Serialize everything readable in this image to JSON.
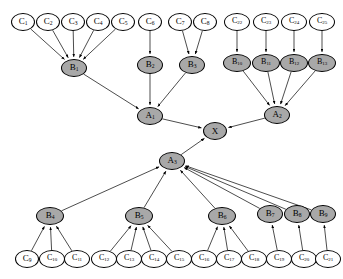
{
  "diagram": {
    "type": "dag",
    "colors": {
      "leaf_fill": "#ffffff",
      "shaded_fill": "#a8a8a8",
      "stroke": "#000000",
      "edge": "#000000",
      "background": "#ffffff"
    },
    "legend": {
      "leaf_meaning": "unshaded node",
      "shaded_meaning": "shaded node"
    }
  },
  "nodes": [
    {
      "id": "C1",
      "label": "C",
      "sub": "1",
      "style": "leaf",
      "cx": 23,
      "cy": 22,
      "rx": 12,
      "ry": 9
    },
    {
      "id": "C2",
      "label": "C",
      "sub": "2",
      "style": "leaf",
      "cx": 48,
      "cy": 22,
      "rx": 12,
      "ry": 9
    },
    {
      "id": "C3",
      "label": "C",
      "sub": "3",
      "style": "leaf",
      "cx": 73,
      "cy": 22,
      "rx": 12,
      "ry": 9
    },
    {
      "id": "C4",
      "label": "C",
      "sub": "4",
      "style": "leaf",
      "cx": 98,
      "cy": 22,
      "rx": 12,
      "ry": 9
    },
    {
      "id": "C5",
      "label": "C",
      "sub": "5",
      "style": "leaf",
      "cx": 123,
      "cy": 22,
      "rx": 12,
      "ry": 9
    },
    {
      "id": "C6",
      "label": "C",
      "sub": "6",
      "style": "leaf",
      "cx": 150,
      "cy": 22,
      "rx": 12,
      "ry": 9
    },
    {
      "id": "C7",
      "label": "C",
      "sub": "7",
      "style": "leaf",
      "cx": 180,
      "cy": 22,
      "rx": 12,
      "ry": 9
    },
    {
      "id": "C8",
      "label": "C",
      "sub": "8",
      "style": "leaf",
      "cx": 205,
      "cy": 22,
      "rx": 12,
      "ry": 9
    },
    {
      "id": "C22",
      "label": "C",
      "sub": "22",
      "style": "leaf",
      "cx": 237,
      "cy": 22,
      "rx": 13,
      "ry": 9
    },
    {
      "id": "C23",
      "label": "C",
      "sub": "23",
      "style": "leaf",
      "cx": 266,
      "cy": 22,
      "rx": 13,
      "ry": 9
    },
    {
      "id": "C24",
      "label": "C",
      "sub": "24",
      "style": "leaf",
      "cx": 294,
      "cy": 22,
      "rx": 13,
      "ry": 9
    },
    {
      "id": "C25",
      "label": "C",
      "sub": "25",
      "style": "leaf",
      "cx": 322,
      "cy": 22,
      "rx": 13,
      "ry": 9
    },
    {
      "id": "B1",
      "label": "B",
      "sub": "1",
      "style": "shaded",
      "cx": 74,
      "cy": 68,
      "rx": 13,
      "ry": 9
    },
    {
      "id": "B2",
      "label": "B",
      "sub": "2",
      "style": "shaded",
      "cx": 150,
      "cy": 65,
      "rx": 13,
      "ry": 9
    },
    {
      "id": "B3",
      "label": "B",
      "sub": "3",
      "style": "shaded",
      "cx": 192,
      "cy": 65,
      "rx": 13,
      "ry": 9
    },
    {
      "id": "B10",
      "label": "B",
      "sub": "10",
      "style": "shaded",
      "cx": 237,
      "cy": 63,
      "rx": 14,
      "ry": 9
    },
    {
      "id": "B11",
      "label": "B",
      "sub": "11",
      "style": "shaded",
      "cx": 266,
      "cy": 63,
      "rx": 14,
      "ry": 9
    },
    {
      "id": "B12",
      "label": "B",
      "sub": "12",
      "style": "shaded",
      "cx": 294,
      "cy": 63,
      "rx": 14,
      "ry": 9
    },
    {
      "id": "B13",
      "label": "B",
      "sub": "13",
      "style": "shaded",
      "cx": 322,
      "cy": 63,
      "rx": 14,
      "ry": 9
    },
    {
      "id": "A1",
      "label": "A",
      "sub": "1",
      "style": "shaded",
      "cx": 150,
      "cy": 116,
      "rx": 13,
      "ry": 9
    },
    {
      "id": "A2",
      "label": "A",
      "sub": "2",
      "style": "shaded",
      "cx": 277,
      "cy": 115,
      "rx": 13,
      "ry": 9
    },
    {
      "id": "X",
      "label": "X",
      "sub": "",
      "style": "shaded",
      "cx": 215,
      "cy": 131,
      "rx": 12,
      "ry": 9
    },
    {
      "id": "A3",
      "label": "A",
      "sub": "3",
      "style": "shaded",
      "cx": 172,
      "cy": 161,
      "rx": 13,
      "ry": 9
    },
    {
      "id": "B4",
      "label": "B",
      "sub": "4",
      "style": "shaded",
      "cx": 50,
      "cy": 216,
      "rx": 14,
      "ry": 9
    },
    {
      "id": "B5",
      "label": "B",
      "sub": "5",
      "style": "shaded",
      "cx": 139,
      "cy": 216,
      "rx": 14,
      "ry": 9
    },
    {
      "id": "B6",
      "label": "B",
      "sub": "6",
      "style": "shaded",
      "cx": 222,
      "cy": 216,
      "rx": 14,
      "ry": 9
    },
    {
      "id": "B7",
      "label": "B",
      "sub": "7",
      "style": "shaded",
      "cx": 270,
      "cy": 214,
      "rx": 13,
      "ry": 9
    },
    {
      "id": "B8",
      "label": "B",
      "sub": "8",
      "style": "shaded",
      "cx": 297,
      "cy": 214,
      "rx": 13,
      "ry": 9
    },
    {
      "id": "B9",
      "label": "B",
      "sub": "9",
      "style": "shaded",
      "cx": 323,
      "cy": 214,
      "rx": 13,
      "ry": 9
    },
    {
      "id": "C9",
      "label": "C",
      "sub": "9",
      "style": "leaf",
      "cx": 27,
      "cy": 259,
      "rx": 12,
      "ry": 9
    },
    {
      "id": "C10",
      "label": "C",
      "sub": "10",
      "style": "leaf",
      "cx": 52,
      "cy": 259,
      "rx": 13,
      "ry": 9
    },
    {
      "id": "C11",
      "label": "C",
      "sub": "11",
      "style": "leaf",
      "cx": 77,
      "cy": 259,
      "rx": 13,
      "ry": 9
    },
    {
      "id": "C12",
      "label": "C",
      "sub": "12",
      "style": "leaf",
      "cx": 104,
      "cy": 259,
      "rx": 13,
      "ry": 9
    },
    {
      "id": "C13",
      "label": "C",
      "sub": "13",
      "style": "leaf",
      "cx": 129,
      "cy": 259,
      "rx": 13,
      "ry": 9
    },
    {
      "id": "C14",
      "label": "C",
      "sub": "14",
      "style": "leaf",
      "cx": 154,
      "cy": 259,
      "rx": 13,
      "ry": 9
    },
    {
      "id": "C15",
      "label": "C",
      "sub": "15",
      "style": "leaf",
      "cx": 179,
      "cy": 259,
      "rx": 13,
      "ry": 9
    },
    {
      "id": "C16",
      "label": "C",
      "sub": "16",
      "style": "leaf",
      "cx": 204,
      "cy": 259,
      "rx": 13,
      "ry": 9
    },
    {
      "id": "C17",
      "label": "C",
      "sub": "17",
      "style": "leaf",
      "cx": 229,
      "cy": 259,
      "rx": 13,
      "ry": 9
    },
    {
      "id": "C18",
      "label": "C",
      "sub": "18",
      "style": "leaf",
      "cx": 254,
      "cy": 259,
      "rx": 13,
      "ry": 9
    },
    {
      "id": "C19",
      "label": "C",
      "sub": "19",
      "style": "leaf",
      "cx": 279,
      "cy": 259,
      "rx": 13,
      "ry": 9
    },
    {
      "id": "C20",
      "label": "C",
      "sub": "20",
      "style": "leaf",
      "cx": 304,
      "cy": 259,
      "rx": 13,
      "ry": 9
    },
    {
      "id": "C21",
      "label": "C",
      "sub": "21",
      "style": "leaf",
      "cx": 328,
      "cy": 259,
      "rx": 13,
      "ry": 9
    }
  ],
  "edges": [
    {
      "from": "C1",
      "to": "B1"
    },
    {
      "from": "C2",
      "to": "B1"
    },
    {
      "from": "C3",
      "to": "B1"
    },
    {
      "from": "C4",
      "to": "B1"
    },
    {
      "from": "C5",
      "to": "B1"
    },
    {
      "from": "C6",
      "to": "B2"
    },
    {
      "from": "C7",
      "to": "B3"
    },
    {
      "from": "C8",
      "to": "B3"
    },
    {
      "from": "C22",
      "to": "B10"
    },
    {
      "from": "C23",
      "to": "B11"
    },
    {
      "from": "C24",
      "to": "B12"
    },
    {
      "from": "C25",
      "to": "B13"
    },
    {
      "from": "B1",
      "to": "A1"
    },
    {
      "from": "B2",
      "to": "A1"
    },
    {
      "from": "B3",
      "to": "A1"
    },
    {
      "from": "B10",
      "to": "A2"
    },
    {
      "from": "B11",
      "to": "A2"
    },
    {
      "from": "B12",
      "to": "A2"
    },
    {
      "from": "B13",
      "to": "A2"
    },
    {
      "from": "A1",
      "to": "X"
    },
    {
      "from": "A2",
      "to": "X"
    },
    {
      "from": "A3",
      "to": "X"
    },
    {
      "from": "B4",
      "to": "A3"
    },
    {
      "from": "B5",
      "to": "A3"
    },
    {
      "from": "B6",
      "to": "A3"
    },
    {
      "from": "B7",
      "to": "A3"
    },
    {
      "from": "B8",
      "to": "A3"
    },
    {
      "from": "B9",
      "to": "A3"
    },
    {
      "from": "C9",
      "to": "B4"
    },
    {
      "from": "C10",
      "to": "B4"
    },
    {
      "from": "C11",
      "to": "B4"
    },
    {
      "from": "C12",
      "to": "B5"
    },
    {
      "from": "C13",
      "to": "B5"
    },
    {
      "from": "C14",
      "to": "B5"
    },
    {
      "from": "C15",
      "to": "B5"
    },
    {
      "from": "C16",
      "to": "B6"
    },
    {
      "from": "C17",
      "to": "B6"
    },
    {
      "from": "C18",
      "to": "B6"
    },
    {
      "from": "C19",
      "to": "B7"
    },
    {
      "from": "C20",
      "to": "B8"
    },
    {
      "from": "C21",
      "to": "B9"
    }
  ]
}
